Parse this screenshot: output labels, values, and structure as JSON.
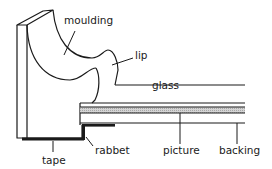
{
  "diagram": {
    "labels": {
      "moulding": "moulding",
      "lip": "lip",
      "glass": "glass",
      "tape": "tape",
      "rabbet": "rabbet",
      "picture": "picture",
      "backing": "backing"
    },
    "colors": {
      "line": "#1a1a1a",
      "picture_fill": "#c8c8c8",
      "background": "#ffffff"
    }
  }
}
